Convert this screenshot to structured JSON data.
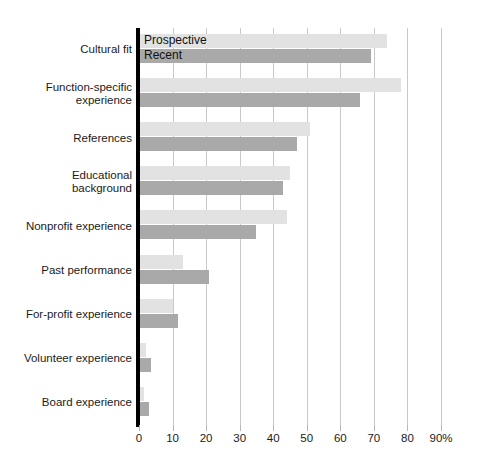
{
  "chart_data": {
    "type": "bar",
    "orientation": "horizontal",
    "title": "",
    "xlabel": "",
    "ylabel": "",
    "xlim": [
      0,
      90
    ],
    "xticks": [
      0,
      10,
      20,
      30,
      40,
      50,
      60,
      70,
      80,
      90
    ],
    "xtick_labels": [
      "0",
      "10",
      "20",
      "30",
      "40",
      "50",
      "60",
      "70",
      "80",
      "90%"
    ],
    "grid": true,
    "legend_position": "inside-first-bars",
    "categories": [
      "Cultural fit",
      "Function-specific experience",
      "References",
      "Educational background",
      "Nonprofit experience",
      "Past performance",
      "For-profit experience",
      "Volunteer experience",
      "Board experience"
    ],
    "category_lines": [
      [
        "Cultural fit"
      ],
      [
        "Function-specific",
        "experience"
      ],
      [
        "References"
      ],
      [
        "Educational",
        "background"
      ],
      [
        "Nonprofit experience"
      ],
      [
        "Past performance"
      ],
      [
        "For-profit experience"
      ],
      [
        "Volunteer experience"
      ],
      [
        "Board experience"
      ]
    ],
    "series": [
      {
        "name": "Prospective",
        "color": "#e2e2e2",
        "values": [
          74,
          78,
          51,
          45,
          44,
          13,
          10,
          2,
          1.5
        ]
      },
      {
        "name": "Recent",
        "color": "#a9a9a9",
        "values": [
          69,
          66,
          47,
          43,
          35,
          21,
          11.5,
          3.5,
          3
        ]
      }
    ]
  },
  "legend": {
    "prospective_label": "Prospective",
    "recent_label": "Recent"
  },
  "colors": {
    "prospective": "#e2e2e2",
    "recent": "#a9a9a9",
    "axis": "#000000",
    "gridline": "#c9c9c9",
    "text": "#1b1b1b",
    "background": "#ffffff"
  }
}
